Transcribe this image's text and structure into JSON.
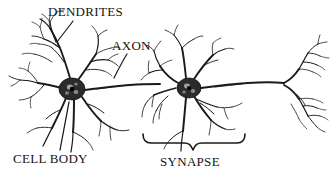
{
  "figure": {
    "background_color": "#ffffff",
    "ink_color": "#1a1a1a"
  },
  "labels": {
    "dendrites": "DENDRITES",
    "axon": "AXON",
    "cell_body": "CELL BODY",
    "synapse": "SYNAPSE"
  },
  "structures": {
    "neuron_one": "neuron-1",
    "neuron_two": "neuron-2",
    "terminal_arbor": "terminal-arbor"
  }
}
